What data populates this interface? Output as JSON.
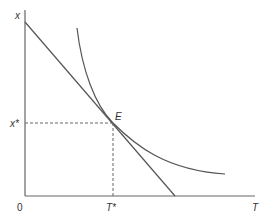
{
  "diagram": {
    "type": "indifference-curve-tangency",
    "labels": {
      "y_axis": "x",
      "x_axis": "T",
      "origin": "0",
      "tangency_point": "E",
      "y_star": "x*",
      "x_star": "T*"
    },
    "colors": {
      "line": "#555555",
      "dashed": "#666666",
      "background": "#ffffff"
    }
  }
}
